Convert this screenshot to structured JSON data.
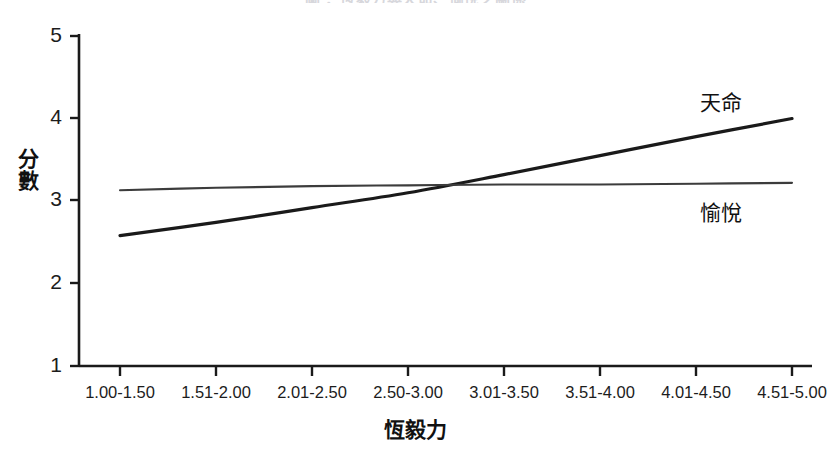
{
  "chart_data": {
    "type": "line",
    "title": "",
    "title_remnant": "圖 ：恆毅力與天命、愉悅之關係",
    "xlabel": "恆毅力",
    "ylabel": "分數",
    "categories": [
      "1.00-1.50",
      "1.51-2.00",
      "2.01-2.50",
      "2.50-3.00",
      "3.01-3.50",
      "3.51-4.00",
      "4.01-4.50",
      "4.51-5.00"
    ],
    "yticks": [
      "1",
      "2",
      "3",
      "4",
      "5"
    ],
    "ylim": [
      1,
      5
    ],
    "grid": false,
    "legend_position": "inline-right",
    "series": [
      {
        "name": "天命",
        "color": "#1a1a1a",
        "values": [
          2.58,
          2.74,
          2.92,
          3.1,
          3.32,
          3.55,
          3.78,
          4.0
        ],
        "label_x": 700,
        "label_y": 86
      },
      {
        "name": "愉悅",
        "color": "#3c3c3c",
        "values": [
          3.13,
          3.16,
          3.18,
          3.19,
          3.2,
          3.2,
          3.21,
          3.22
        ],
        "label_x": 700,
        "label_y": 196
      }
    ],
    "crossing_point": {
      "category": "2.50-3.00",
      "value": 3.18
    }
  }
}
